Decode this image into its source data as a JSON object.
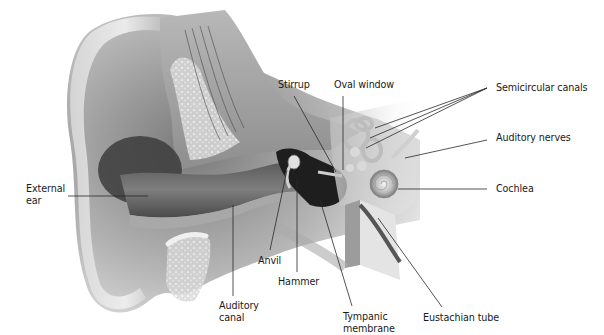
{
  "diagram": {
    "colors": {
      "background": "#ffffff",
      "label_text": "#1a1a1a",
      "leader_line": "#2a2a2a",
      "tissue_light": "#d9d9d9",
      "tissue_mid": "#9a9a9a",
      "tissue_dark": "#3a3a3a",
      "bone": "#e6e6e6"
    },
    "labels": [
      {
        "id": "external-ear",
        "lines": [
          "External",
          "ear"
        ]
      },
      {
        "id": "stirrup",
        "lines": [
          "Stirrup"
        ]
      },
      {
        "id": "oval-window",
        "lines": [
          "Oval window"
        ]
      },
      {
        "id": "semicircular-canals",
        "lines": [
          "Semicircular canals"
        ]
      },
      {
        "id": "auditory-nerves",
        "lines": [
          "Auditory nerves"
        ]
      },
      {
        "id": "cochlea",
        "lines": [
          "Cochlea"
        ]
      },
      {
        "id": "anvil",
        "lines": [
          "Anvil"
        ]
      },
      {
        "id": "hammer",
        "lines": [
          "Hammer"
        ]
      },
      {
        "id": "auditory-canal",
        "lines": [
          "Auditory",
          "canal"
        ]
      },
      {
        "id": "tympanic-membrane",
        "lines": [
          "Tympanic",
          "membrane"
        ]
      },
      {
        "id": "eustachian-tube",
        "lines": [
          "Eustachian tube"
        ]
      }
    ]
  }
}
